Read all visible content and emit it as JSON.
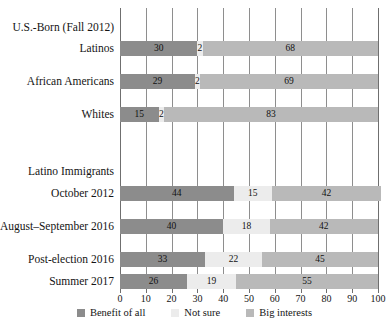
{
  "chart_data": {
    "type": "bar",
    "subtype": "stacked-horizontal-100pct",
    "title": "",
    "xlabel": "",
    "ylabel": "",
    "xlim": [
      0,
      100
    ],
    "xticks": [
      0,
      10,
      20,
      30,
      40,
      50,
      60,
      70,
      80,
      90,
      100
    ],
    "xtick_labels": [
      "0",
      "10",
      "20",
      "30",
      "40",
      "50",
      "60",
      "70",
      "80",
      "90",
      "100"
    ],
    "grid": true,
    "legend_position": "bottom-center",
    "series": [
      {
        "name": "Benefit of all",
        "color": "#8c8c8c",
        "values": [
          30,
          29,
          15,
          44,
          40,
          33,
          26
        ]
      },
      {
        "name": "Not sure",
        "color": "#ececec",
        "values": [
          2,
          2,
          2,
          15,
          18,
          22,
          19
        ]
      },
      {
        "name": "Big interests",
        "color": "#b9b9b9",
        "values": [
          68,
          69,
          83,
          42,
          42,
          45,
          55
        ]
      }
    ],
    "categories": [
      "Latinos",
      "African Americans",
      "Whites",
      "October 2012",
      "August–September 2016",
      "Post-election 2016",
      "Summer 2017"
    ],
    "groups": [
      {
        "label": "U.S.-Born (Fall 2012)",
        "categories": [
          "Latinos",
          "African Americans",
          "Whites"
        ]
      },
      {
        "label": "Latino Immigrants",
        "categories": [
          "October 2012",
          "August–September 2016",
          "Post-election 2016",
          "Summer 2017"
        ]
      }
    ]
  },
  "groups": [
    {
      "label": "U.S.-Born (Fall 2012)"
    },
    {
      "label": "Latino Immigrants"
    }
  ],
  "rows": [
    {
      "label": "Latinos",
      "benefit": "30",
      "notsure": "2",
      "big": "68"
    },
    {
      "label": "African Americans",
      "benefit": "29",
      "notsure": "2",
      "big": "69"
    },
    {
      "label": "Whites",
      "benefit": "15",
      "notsure": "2",
      "big": "83"
    },
    {
      "label": "October 2012",
      "benefit": "44",
      "notsure": "15",
      "big": "42"
    },
    {
      "label": "August–September 2016",
      "benefit": "40",
      "notsure": "18",
      "big": "42"
    },
    {
      "label": "Post-election 2016",
      "benefit": "33",
      "notsure": "22",
      "big": "45"
    },
    {
      "label": "Summer 2017",
      "benefit": "26",
      "notsure": "19",
      "big": "55"
    }
  ],
  "axis": {
    "ticks": [
      {
        "label": "0"
      },
      {
        "label": "10"
      },
      {
        "label": "20"
      },
      {
        "label": "30"
      },
      {
        "label": "40"
      },
      {
        "label": "50"
      },
      {
        "label": "60"
      },
      {
        "label": "70"
      },
      {
        "label": "80"
      },
      {
        "label": "90"
      },
      {
        "label": "100"
      }
    ]
  },
  "legend": {
    "items": [
      {
        "label": "Benefit of all",
        "color": "#8c8c8c"
      },
      {
        "label": "Not sure",
        "color": "#ececec"
      },
      {
        "label": "Big interests",
        "color": "#b9b9b9"
      }
    ]
  },
  "colors": {
    "benefit_of_all": "#8c8c8c",
    "not_sure": "#ececec",
    "big_interests": "#b9b9b9",
    "gridline": "#8e8e8e",
    "text": "#141414",
    "background": "#ffffff"
  }
}
